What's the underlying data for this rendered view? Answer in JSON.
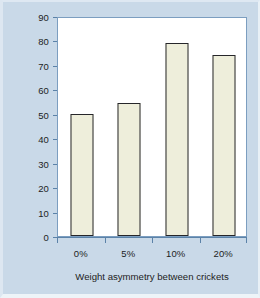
{
  "chart_data": {
    "type": "bar",
    "title": "",
    "categories": [
      "0%",
      "5%",
      "10%",
      "20%"
    ],
    "values": [
      50,
      54.5,
      79,
      74
    ],
    "series": [
      {
        "name": "Probability of larger animal winning",
        "values": [
          50,
          54.5,
          79,
          74
        ]
      }
    ],
    "xlabel": "Weight asymmetry between crickets",
    "ylabel": "Probability of larger animal winning",
    "ylim": [
      0,
      90
    ],
    "ytick_labels": [
      "0",
      "10",
      "20",
      "30",
      "40",
      "50",
      "60",
      "70",
      "80",
      "90"
    ],
    "ytick_values": [
      0,
      10,
      20,
      30,
      40,
      50,
      60,
      70,
      80,
      90
    ],
    "xtick_labels": [
      "0%",
      "5%",
      "10%",
      "20%"
    ],
    "grid": false,
    "legend": false,
    "legend_position": "none",
    "colors": {
      "figure_background": "#c9d9e8",
      "plot_background": "#ffffff",
      "bar_fill": "#eeeedb",
      "bar_border": "#26262a",
      "axis_line": "#5b82a8",
      "plot_frame": "#7c9ec0",
      "text": "#1d1d1d"
    }
  }
}
